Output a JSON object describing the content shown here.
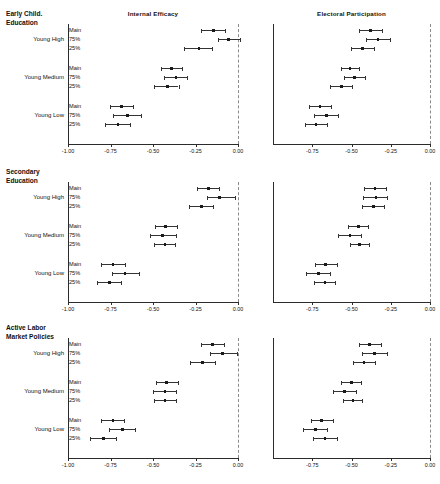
{
  "figure": {
    "columns": [
      {
        "key": "internal_efficacy",
        "title": "Internal Efficacy"
      },
      {
        "key": "electoral_participation",
        "title": "Electoral Participation"
      }
    ],
    "panels": [
      {
        "key": "early_child",
        "title": "Early Child.\nEducation"
      },
      {
        "key": "secondary",
        "title": "Secondary\nEducation"
      },
      {
        "key": "almp",
        "title": "Active Labor\nMarket Policies"
      }
    ],
    "groups": [
      "Young High",
      "Young Medium",
      "Young Low"
    ],
    "models": [
      "Main",
      "75%",
      "25%"
    ],
    "footer_note": ""
  },
  "axes": {
    "left": {
      "min": -1.0,
      "max": 0.0,
      "ticks": [
        -1.0,
        -0.75,
        -0.5,
        -0.25,
        0.0
      ],
      "tick_labels": [
        "-1.00",
        "-0.75",
        "-0.50",
        "-0.25",
        "0.00"
      ],
      "reference_line": 0.0
    },
    "right": {
      "min": -1.0,
      "max": 0.0,
      "ticks": [
        -0.75,
        -0.5,
        -0.25,
        0.0
      ],
      "tick_labels": [
        "-0.75",
        "-0.50",
        "-0.25",
        "0.00"
      ],
      "reference_line": 0.0
    }
  },
  "colors": {
    "point": "#1a1a1a",
    "interval": "#333333",
    "axis": "#2b2b2b",
    "reference": "#8a8a8a",
    "background": "#ffffff"
  },
  "chart_data": {
    "type": "scatter",
    "title": "",
    "subtitle": "",
    "xlabel": "",
    "ylabel": "",
    "xlim": [
      -1.0,
      0.0
    ],
    "grid": false,
    "legend": "none",
    "panels": [
      {
        "panel": "Early Child. Education",
        "column": "Internal Efficacy",
        "rows": [
          {
            "group": "Young High",
            "model": "Main",
            "estimate": -0.145,
            "low": -0.215,
            "high": -0.075
          },
          {
            "group": "Young High",
            "model": "75%",
            "estimate": -0.055,
            "low": -0.12,
            "high": 0.012
          },
          {
            "group": "Young High",
            "model": "25%",
            "estimate": -0.23,
            "low": -0.32,
            "high": -0.155
          },
          {
            "group": "Young Medium",
            "model": "Main",
            "estimate": -0.39,
            "low": -0.455,
            "high": -0.33
          },
          {
            "group": "Young Medium",
            "model": "75%",
            "estimate": -0.365,
            "low": -0.435,
            "high": -0.3
          },
          {
            "group": "Young Medium",
            "model": "25%",
            "estimate": -0.415,
            "low": -0.495,
            "high": -0.35
          },
          {
            "group": "Young Low",
            "model": "Main",
            "estimate": -0.685,
            "low": -0.755,
            "high": -0.615
          },
          {
            "group": "Young Low",
            "model": "75%",
            "estimate": -0.65,
            "low": -0.735,
            "high": -0.57
          },
          {
            "group": "Young Low",
            "model": "25%",
            "estimate": -0.705,
            "low": -0.78,
            "high": -0.635
          }
        ]
      },
      {
        "panel": "Early Child. Education",
        "column": "Electoral Participation",
        "rows": [
          {
            "group": "Young High",
            "model": "Main",
            "estimate": -0.38,
            "low": -0.45,
            "high": -0.305
          },
          {
            "group": "Young High",
            "model": "75%",
            "estimate": -0.33,
            "low": -0.405,
            "high": -0.255
          },
          {
            "group": "Young High",
            "model": "25%",
            "estimate": -0.43,
            "low": -0.505,
            "high": -0.355
          },
          {
            "group": "Young Medium",
            "model": "Main",
            "estimate": -0.51,
            "low": -0.57,
            "high": -0.45
          },
          {
            "group": "Young Medium",
            "model": "75%",
            "estimate": -0.48,
            "low": -0.55,
            "high": -0.415
          },
          {
            "group": "Young Medium",
            "model": "25%",
            "estimate": -0.565,
            "low": -0.64,
            "high": -0.495
          },
          {
            "group": "Young Low",
            "model": "Main",
            "estimate": -0.7,
            "low": -0.77,
            "high": -0.63
          },
          {
            "group": "Young Low",
            "model": "75%",
            "estimate": -0.66,
            "low": -0.74,
            "high": -0.585
          },
          {
            "group": "Young Low",
            "model": "25%",
            "estimate": -0.725,
            "low": -0.795,
            "high": -0.655
          }
        ]
      },
      {
        "panel": "Secondary Education",
        "column": "Internal Efficacy",
        "rows": [
          {
            "group": "Young High",
            "model": "Main",
            "estimate": -0.175,
            "low": -0.24,
            "high": -0.11
          },
          {
            "group": "Young High",
            "model": "75%",
            "estimate": -0.11,
            "low": -0.18,
            "high": -0.02
          },
          {
            "group": "Young High",
            "model": "25%",
            "estimate": -0.215,
            "low": -0.29,
            "high": -0.145
          },
          {
            "group": "Young Medium",
            "model": "Main",
            "estimate": -0.425,
            "low": -0.49,
            "high": -0.36
          },
          {
            "group": "Young Medium",
            "model": "75%",
            "estimate": -0.445,
            "low": -0.52,
            "high": -0.365
          },
          {
            "group": "Young Medium",
            "model": "25%",
            "estimate": -0.43,
            "low": -0.495,
            "high": -0.37
          },
          {
            "group": "Young Low",
            "model": "Main",
            "estimate": -0.735,
            "low": -0.805,
            "high": -0.665
          },
          {
            "group": "Young Low",
            "model": "75%",
            "estimate": -0.665,
            "low": -0.74,
            "high": -0.585
          },
          {
            "group": "Young Low",
            "model": "25%",
            "estimate": -0.755,
            "low": -0.83,
            "high": -0.69
          }
        ]
      },
      {
        "panel": "Secondary Education",
        "column": "Electoral Participation",
        "rows": [
          {
            "group": "Young High",
            "model": "Main",
            "estimate": -0.35,
            "low": -0.42,
            "high": -0.28
          },
          {
            "group": "Young High",
            "model": "75%",
            "estimate": -0.345,
            "low": -0.425,
            "high": -0.275
          },
          {
            "group": "Young High",
            "model": "25%",
            "estimate": -0.36,
            "low": -0.43,
            "high": -0.29
          },
          {
            "group": "Young Medium",
            "model": "Main",
            "estimate": -0.455,
            "low": -0.52,
            "high": -0.395
          },
          {
            "group": "Young Medium",
            "model": "75%",
            "estimate": -0.51,
            "low": -0.585,
            "high": -0.44
          },
          {
            "group": "Young Medium",
            "model": "25%",
            "estimate": -0.45,
            "low": -0.51,
            "high": -0.39
          },
          {
            "group": "Young Low",
            "model": "Main",
            "estimate": -0.665,
            "low": -0.735,
            "high": -0.595
          },
          {
            "group": "Young Low",
            "model": "75%",
            "estimate": -0.71,
            "low": -0.79,
            "high": -0.635
          },
          {
            "group": "Young Low",
            "model": "25%",
            "estimate": -0.67,
            "low": -0.74,
            "high": -0.605
          }
        ]
      },
      {
        "panel": "Active Labor Market Policies",
        "column": "Internal Efficacy",
        "rows": [
          {
            "group": "Young High",
            "model": "Main",
            "estimate": -0.15,
            "low": -0.215,
            "high": -0.085
          },
          {
            "group": "Young High",
            "model": "75%",
            "estimate": -0.09,
            "low": -0.165,
            "high": -0.005
          },
          {
            "group": "Young High",
            "model": "25%",
            "estimate": -0.21,
            "low": -0.285,
            "high": -0.135
          },
          {
            "group": "Young Medium",
            "model": "Main",
            "estimate": -0.42,
            "low": -0.485,
            "high": -0.355
          },
          {
            "group": "Young Medium",
            "model": "75%",
            "estimate": -0.43,
            "low": -0.5,
            "high": -0.365
          },
          {
            "group": "Young Medium",
            "model": "25%",
            "estimate": -0.43,
            "low": -0.495,
            "high": -0.365
          },
          {
            "group": "Young Low",
            "model": "Main",
            "estimate": -0.735,
            "low": -0.805,
            "high": -0.67
          },
          {
            "group": "Young Low",
            "model": "75%",
            "estimate": -0.68,
            "low": -0.76,
            "high": -0.605
          },
          {
            "group": "Young Low",
            "model": "25%",
            "estimate": -0.79,
            "low": -0.87,
            "high": -0.72
          }
        ]
      },
      {
        "panel": "Active Labor Market Policies",
        "column": "Electoral Participation",
        "rows": [
          {
            "group": "Young High",
            "model": "Main",
            "estimate": -0.385,
            "low": -0.45,
            "high": -0.315
          },
          {
            "group": "Young High",
            "model": "75%",
            "estimate": -0.355,
            "low": -0.43,
            "high": -0.275
          },
          {
            "group": "Young High",
            "model": "25%",
            "estimate": -0.42,
            "low": -0.49,
            "high": -0.35
          },
          {
            "group": "Young Medium",
            "model": "Main",
            "estimate": -0.5,
            "low": -0.565,
            "high": -0.44
          },
          {
            "group": "Young Medium",
            "model": "75%",
            "estimate": -0.545,
            "low": -0.62,
            "high": -0.47
          },
          {
            "group": "Young Medium",
            "model": "25%",
            "estimate": -0.49,
            "low": -0.555,
            "high": -0.43
          },
          {
            "group": "Young Low",
            "model": "Main",
            "estimate": -0.69,
            "low": -0.76,
            "high": -0.62
          },
          {
            "group": "Young Low",
            "model": "75%",
            "estimate": -0.73,
            "low": -0.81,
            "high": -0.655
          },
          {
            "group": "Young Low",
            "model": "25%",
            "estimate": -0.67,
            "low": -0.745,
            "high": -0.595
          }
        ]
      }
    ]
  }
}
